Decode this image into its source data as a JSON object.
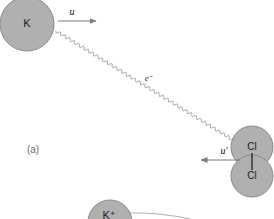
{
  "figure": {
    "panel_label": "(a)",
    "background_color": "#ffffff",
    "sphere_fill_color": "#b0b0b0",
    "sphere_stroke_color": "#8a8a8a",
    "arrow_color": "#7d7d7d",
    "squiggle_color": "#9b9b9b",
    "bond_color": "#2b2b2b"
  },
  "particles": {
    "potassium_atom": {
      "label": "K",
      "cx": 27,
      "cy": 24,
      "r": 27
    },
    "potassium_ion": {
      "label": "K⁺",
      "cx": 110,
      "cy": 222,
      "r": 22
    },
    "chlorine_top": {
      "label": "Cl",
      "cx": 252,
      "cy": 147,
      "r": 21
    },
    "chlorine_bottom": {
      "label": "Cl",
      "cx": 252,
      "cy": 176,
      "r": 21
    }
  },
  "vectors": {
    "potassium_velocity": {
      "label": "u",
      "label_x": 72,
      "label_y": 13,
      "x1": 58,
      "y1": 21,
      "x2": 96,
      "y2": 21,
      "direction": "right"
    },
    "chlorine_velocity": {
      "label": "u′",
      "label_x": 224,
      "label_y": 152,
      "x1": 240,
      "y1": 160,
      "x2": 201,
      "y2": 160,
      "direction": "left"
    }
  },
  "electron_transfer": {
    "label": "e⁻",
    "label_x": 149,
    "label_y": 79,
    "path_start_x": 56,
    "path_start_y": 31,
    "path_end_x": 233,
    "path_end_y": 140,
    "style": "wavy"
  },
  "icons": {
    "arrowhead": "arrowhead-icon",
    "wavy_path": "wavy-electron-path-icon",
    "bond": "covalent-bond-icon"
  }
}
